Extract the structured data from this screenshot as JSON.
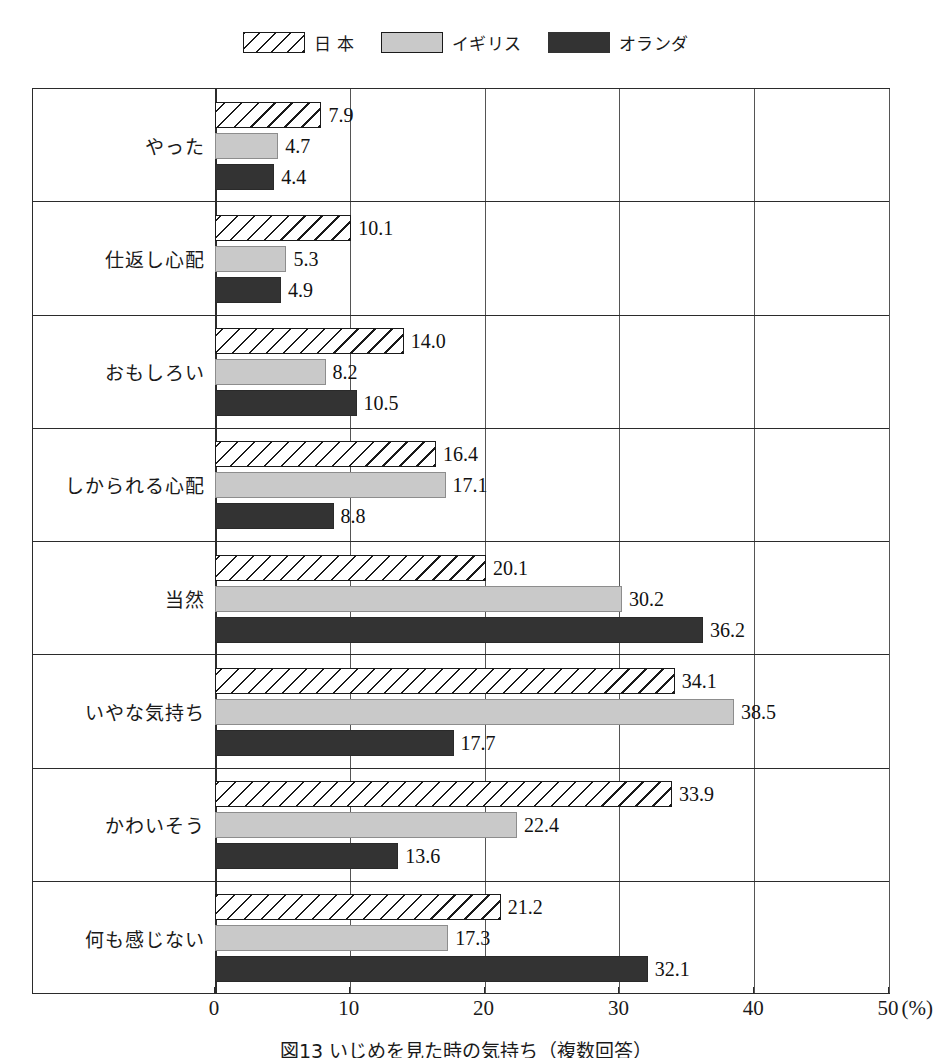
{
  "legend": {
    "items": [
      {
        "label": "日 本",
        "swatch": "hatched-swatch-icon"
      },
      {
        "label": "イギリス",
        "swatch": "gray-swatch-icon"
      },
      {
        "label": "オランダ",
        "swatch": "dark-swatch-icon"
      }
    ]
  },
  "caption": "図13 いじめを見た時の気持ち（複数回答）",
  "axis": {
    "ticks": [
      "0",
      "10",
      "20",
      "30",
      "40",
      "50"
    ],
    "unit": "(%)"
  },
  "chart_data": {
    "type": "bar",
    "orientation": "horizontal",
    "title": "図13 いじめを見た時の気持ち（複数回答）",
    "xlabel": "(%)",
    "ylabel": "",
    "xlim": [
      0,
      50
    ],
    "xticks": [
      0,
      10,
      20,
      30,
      40,
      50
    ],
    "grid": true,
    "legend_position": "top-center",
    "categories": [
      "やった",
      "仕返し心配",
      "おもしろい",
      "しかられる心配",
      "当然",
      "いやな気持ち",
      "かわいそう",
      "何も感じない"
    ],
    "series": [
      {
        "name": "日 本",
        "values": [
          7.9,
          10.1,
          14.0,
          16.4,
          20.1,
          34.1,
          33.9,
          21.2
        ]
      },
      {
        "name": "イギリス",
        "values": [
          4.7,
          5.3,
          8.2,
          17.1,
          30.2,
          38.5,
          22.4,
          17.3
        ]
      },
      {
        "name": "オランダ",
        "values": [
          4.4,
          4.9,
          10.5,
          8.8,
          36.2,
          17.7,
          13.6,
          32.1
        ]
      }
    ],
    "value_labels": [
      [
        "7.9",
        "4.7",
        "4.4"
      ],
      [
        "10.1",
        "5.3",
        "4.9"
      ],
      [
        "14.0",
        "8.2",
        "10.5"
      ],
      [
        "16.4",
        "17.1",
        "8.8"
      ],
      [
        "20.1",
        "30.2",
        "36.2"
      ],
      [
        "34.1",
        "38.5",
        "17.7"
      ],
      [
        "33.9",
        "22.4",
        "13.6"
      ],
      [
        "21.2",
        "17.3",
        "32.1"
      ]
    ]
  },
  "colors": {
    "series_japan": "#ffffff",
    "series_uk": "#c9c9c9",
    "series_netherlands": "#333333",
    "frame": "#2b2b2b",
    "grid": "#555555"
  }
}
